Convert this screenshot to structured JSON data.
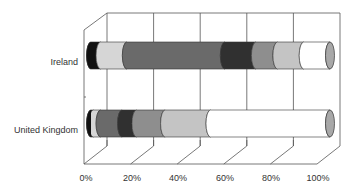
{
  "chart_data": {
    "type": "bar",
    "orientation": "horizontal",
    "stacked": "percent",
    "style": "3d-cylinder",
    "title": "",
    "xlabel": "",
    "ylabel": "",
    "categories": [
      "Ireland",
      "United Kingdom"
    ],
    "x_ticks": [
      "0%",
      "20%",
      "40%",
      "60%",
      "80%",
      "100%"
    ],
    "xlim": [
      0,
      100
    ],
    "grid": true,
    "legend": null,
    "series": [
      {
        "name": "Series 1",
        "color": "#111111",
        "values": [
          4,
          1
        ]
      },
      {
        "name": "Series 2",
        "color": "#d6d6d6",
        "values": [
          11,
          3
        ]
      },
      {
        "name": "Series 3",
        "color": "#6a6a6a",
        "values": [
          41,
          9
        ]
      },
      {
        "name": "Series 4",
        "color": "#303030",
        "values": [
          13,
          6
        ]
      },
      {
        "name": "Series 5",
        "color": "#8e8e8e",
        "values": [
          9,
          12
        ]
      },
      {
        "name": "Series 6",
        "color": "#c4c4c4",
        "values": [
          11,
          19
        ]
      },
      {
        "name": "Series 7",
        "color": "#ffffff",
        "values": [
          11,
          50
        ]
      }
    ]
  },
  "labels": {
    "cat0": "Ireland",
    "cat1": "United Kingdom",
    "t0": "0%",
    "t1": "20%",
    "t2": "40%",
    "t3": "60%",
    "t4": "80%",
    "t5": "100%"
  }
}
